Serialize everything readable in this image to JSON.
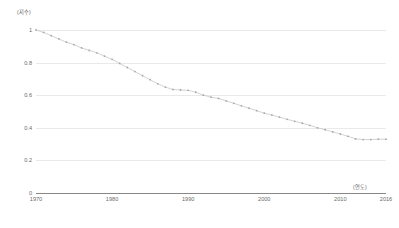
{
  "axis_labels": {
    "y_unit": "(지수)",
    "x_unit": "(연도)"
  },
  "chart_data": {
    "type": "line",
    "title": "",
    "subtitle": "",
    "xlabel": "(연도)",
    "ylabel": "(지수)",
    "xlim": [
      1970,
      2016
    ],
    "ylim": [
      0,
      1
    ],
    "grid": true,
    "legend": false,
    "legend_position": "none",
    "line_color": "#c8c8c8",
    "marker_color": "#a8a8a8",
    "axis_color": "#888888",
    "gridline_color": "#e9e9e9",
    "y_ticks": [
      0,
      0.2,
      0.4,
      0.6,
      0.8,
      1
    ],
    "y_tick_labels": [
      "0",
      "0.2",
      "0.4",
      "0.6",
      "0.8",
      "1"
    ],
    "x_ticks": [
      1970,
      1980,
      1990,
      2000,
      2010,
      2016
    ],
    "x_tick_labels": [
      "1970",
      "1980",
      "1990",
      "2000",
      "2010",
      "2016"
    ],
    "series": [
      {
        "name": "index",
        "x": [
          1970,
          1971,
          1972,
          1973,
          1974,
          1975,
          1976,
          1977,
          1978,
          1979,
          1980,
          1981,
          1982,
          1983,
          1984,
          1985,
          1986,
          1987,
          1988,
          1989,
          1990,
          1991,
          1992,
          1993,
          1994,
          1995,
          1996,
          1997,
          1998,
          1999,
          2000,
          2001,
          2002,
          2003,
          2004,
          2005,
          2006,
          2007,
          2008,
          2009,
          2010,
          2011,
          2012,
          2013,
          2014,
          2015,
          2016
        ],
        "values": [
          1.0,
          0.985,
          0.965,
          0.945,
          0.925,
          0.91,
          0.89,
          0.875,
          0.86,
          0.84,
          0.82,
          0.795,
          0.77,
          0.745,
          0.72,
          0.695,
          0.67,
          0.65,
          0.635,
          0.632,
          0.63,
          0.618,
          0.6,
          0.588,
          0.58,
          0.565,
          0.55,
          0.535,
          0.52,
          0.505,
          0.49,
          0.478,
          0.465,
          0.452,
          0.44,
          0.428,
          0.415,
          0.4,
          0.388,
          0.375,
          0.362,
          0.348,
          0.332,
          0.328,
          0.328,
          0.33,
          0.33
        ]
      }
    ]
  }
}
